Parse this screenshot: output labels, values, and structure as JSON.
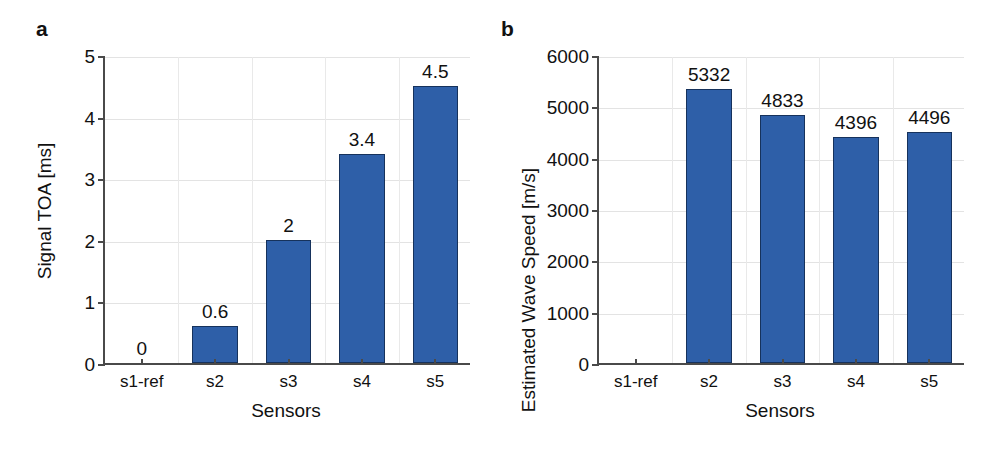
{
  "figure": {
    "background": "#ffffff",
    "bar_color": "#2E5FA8",
    "bar_edge_color": "#16325C",
    "axis_color": "#4A4A4A",
    "grid_color": "#E3E3E3",
    "text_color": "#111111"
  },
  "panels": [
    {
      "id": "a",
      "label": "a",
      "xlabel": "Sensors",
      "ylabel": "Signal TOA [ms]"
    },
    {
      "id": "b",
      "label": "b",
      "xlabel": "Sensors",
      "ylabel": "Estimated Wave Speed [m/s]"
    }
  ],
  "chart_data": [
    {
      "type": "bar",
      "panel": "a",
      "title": "a",
      "xlabel": "Sensors",
      "ylabel": "Signal TOA [ms]",
      "categories": [
        "s1-ref",
        "s2",
        "s3",
        "s4",
        "s5"
      ],
      "values": [
        0,
        0.6,
        2,
        3.4,
        4.5
      ],
      "data_labels": [
        "0",
        "0.6",
        "2",
        "3.4",
        "4.5"
      ],
      "ylim": [
        0,
        5
      ],
      "ytick_values": [
        0,
        1,
        2,
        3,
        4,
        5
      ],
      "ytick_labels": [
        "0",
        "1",
        "2",
        "3",
        "4",
        "5"
      ],
      "grid": true,
      "legend": null
    },
    {
      "type": "bar",
      "panel": "b",
      "title": "b",
      "xlabel": "Sensors",
      "ylabel": "Estimated Wave Speed [m/s]",
      "categories": [
        "s1-ref",
        "s2",
        "s3",
        "s4",
        "s5"
      ],
      "values": [
        0,
        5332,
        4833,
        4396,
        4496
      ],
      "data_labels": [
        "",
        "5332",
        "4833",
        "4396",
        "4496"
      ],
      "ylim": [
        0,
        6000
      ],
      "ytick_values": [
        0,
        1000,
        2000,
        3000,
        4000,
        5000,
        6000
      ],
      "ytick_labels": [
        "0",
        "1000",
        "2000",
        "3000",
        "4000",
        "5000",
        "6000"
      ],
      "grid": true,
      "legend": null
    }
  ]
}
